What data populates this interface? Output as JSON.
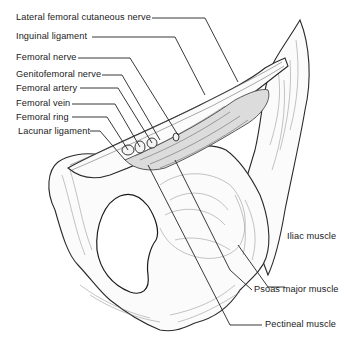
{
  "figure": {
    "labels_left": [
      {
        "id": "lateral-femoral-cutaneous-nerve",
        "text": "Lateral femoral cutaneous nerve"
      },
      {
        "id": "inguinal-ligament",
        "text": "Inguinal ligament"
      },
      {
        "id": "femoral-nerve",
        "text": "Femoral nerve"
      },
      {
        "id": "genitofemoral-nerve",
        "text": "Genitofemoral nerve"
      },
      {
        "id": "femoral-artery",
        "text": "Femoral artery"
      },
      {
        "id": "femoral-vein",
        "text": "Femoral vein"
      },
      {
        "id": "femoral-ring",
        "text": "Femoral ring"
      },
      {
        "id": "lacunar-ligament",
        "text": "Lacunar ligament"
      }
    ],
    "labels_right": [
      {
        "id": "iliac-muscle",
        "text": "Iliac muscle"
      },
      {
        "id": "psoas-major-muscle",
        "text": "Psoas major muscle"
      },
      {
        "id": "pectineal-muscle",
        "text": "Pectineal muscle"
      }
    ]
  }
}
